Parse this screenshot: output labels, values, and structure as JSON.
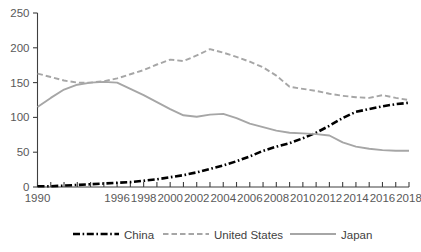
{
  "chart_data": {
    "type": "line",
    "title": "",
    "xlabel": "",
    "ylabel": "",
    "ylim": [
      0,
      250
    ],
    "yticks": [
      0,
      50,
      100,
      150,
      200,
      250
    ],
    "grid": false,
    "legend_position": "bottom",
    "x": [
      1990,
      1991,
      1992,
      1993,
      1994,
      1995,
      1996,
      1997,
      1998,
      1999,
      2000,
      2001,
      2002,
      2003,
      2004,
      2005,
      2006,
      2007,
      2008,
      2009,
      2010,
      2011,
      2012,
      2013,
      2014,
      2015,
      2016,
      2017,
      2018
    ],
    "xtick_labels": [
      "1990",
      "",
      "",
      "",
      "",
      "",
      "1996",
      "",
      "1998",
      "",
      "2000",
      "",
      "2002",
      "",
      "2004",
      "",
      "2006",
      "",
      "2008",
      "",
      "2010",
      "",
      "2012",
      "",
      "2014",
      "",
      "2016",
      "",
      "2018"
    ],
    "series": [
      {
        "name": "China",
        "color": "#000000",
        "style": "dash-dot",
        "values": [
          1,
          1,
          2,
          3,
          4,
          5,
          6,
          7,
          9,
          11,
          14,
          17,
          21,
          26,
          31,
          37,
          44,
          52,
          58,
          63,
          70,
          78,
          88,
          99,
          108,
          112,
          116,
          119,
          121
        ]
      },
      {
        "name": "United States",
        "color": "#a6a6a6",
        "style": "dashed",
        "values": [
          163,
          158,
          153,
          150,
          150,
          152,
          156,
          162,
          168,
          176,
          183,
          181,
          189,
          198,
          193,
          187,
          180,
          172,
          160,
          144,
          141,
          138,
          134,
          131,
          129,
          128,
          132,
          128,
          125
        ]
      },
      {
        "name": "Japan",
        "color": "#a6a6a6",
        "style": "solid",
        "values": [
          115,
          128,
          140,
          147,
          150,
          151,
          150,
          141,
          132,
          122,
          112,
          103,
          101,
          104,
          105,
          99,
          91,
          86,
          81,
          78,
          77,
          76,
          74,
          64,
          58,
          55,
          53,
          52,
          52
        ]
      }
    ]
  },
  "legend": {
    "items": [
      {
        "label": "China"
      },
      {
        "label": "United States"
      },
      {
        "label": "Japan"
      }
    ]
  },
  "colors": {
    "china": "#000000",
    "united_states": "#a6a6a6",
    "japan": "#a6a6a6",
    "axis": "#3f3f3f",
    "tick_text": "#595959",
    "background": "#ffffff"
  }
}
